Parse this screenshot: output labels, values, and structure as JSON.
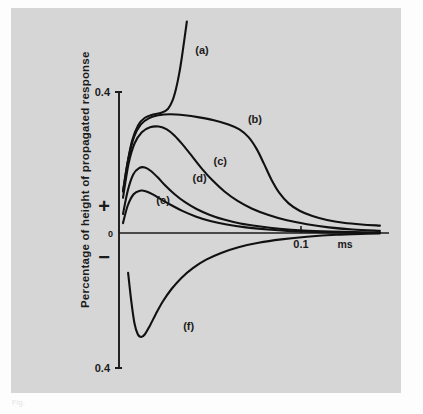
{
  "figure": {
    "background_color": "#d6d6d6",
    "page_color": "#fdfdfd",
    "ink_color": "#111111",
    "caption_fragment": "Fig."
  },
  "chart_data": {
    "type": "line",
    "title": "",
    "xlabel": "",
    "ylabel": "Percentage of height of propagated response",
    "x_unit": "ms",
    "xlim": [
      0,
      0.148
    ],
    "ylim": [
      -0.4,
      0.4
    ],
    "grid": false,
    "legend": "inline-curve-labels",
    "y_ticks": [
      {
        "value": 0.4,
        "label": "0.4"
      },
      {
        "value": 0.0,
        "label": "0"
      },
      {
        "value": -0.4,
        "label": "0.4"
      }
    ],
    "y_sign_markers": [
      {
        "label": "+",
        "value": 0.14
      },
      {
        "label": "−",
        "value": -0.12
      }
    ],
    "x_ticks": [
      {
        "value": 0.1,
        "label": "0.1"
      }
    ],
    "series": [
      {
        "name": "(a)",
        "label": "(a)",
        "label_x": 0.0455,
        "label_y": 0.508,
        "description": "steeply rising curve leaving top of plot",
        "points": [
          [
            0.0022,
            0.118
          ],
          [
            0.0046,
            0.196
          ],
          [
            0.0072,
            0.262
          ],
          [
            0.0105,
            0.306
          ],
          [
            0.0142,
            0.327
          ],
          [
            0.0186,
            0.336
          ],
          [
            0.0232,
            0.341
          ],
          [
            0.0268,
            0.352
          ],
          [
            0.0292,
            0.374
          ],
          [
            0.0312,
            0.408
          ],
          [
            0.033,
            0.452
          ],
          [
            0.0345,
            0.5
          ],
          [
            0.0358,
            0.548
          ],
          [
            0.0372,
            0.6
          ]
        ]
      },
      {
        "name": "(b)",
        "label": "(b)",
        "label_x": 0.0745,
        "label_y": 0.312,
        "description": "broad plateau then steep late fall with long tail",
        "points": [
          [
            0.0022,
            0.118
          ],
          [
            0.005,
            0.208
          ],
          [
            0.0082,
            0.272
          ],
          [
            0.012,
            0.308
          ],
          [
            0.0165,
            0.326
          ],
          [
            0.0215,
            0.334
          ],
          [
            0.028,
            0.337
          ],
          [
            0.036,
            0.334
          ],
          [
            0.044,
            0.328
          ],
          [
            0.052,
            0.32
          ],
          [
            0.06,
            0.308
          ],
          [
            0.066,
            0.294
          ],
          [
            0.071,
            0.272
          ],
          [
            0.0755,
            0.238
          ],
          [
            0.0795,
            0.196
          ],
          [
            0.0835,
            0.152
          ],
          [
            0.088,
            0.113
          ],
          [
            0.093,
            0.084
          ],
          [
            0.099,
            0.063
          ],
          [
            0.106,
            0.048
          ],
          [
            0.114,
            0.037
          ],
          [
            0.123,
            0.029
          ],
          [
            0.133,
            0.024
          ],
          [
            0.143,
            0.021
          ]
        ]
      },
      {
        "name": "(c)",
        "label": "(c)",
        "label_x": 0.0555,
        "label_y": 0.193,
        "description": "rounded peak then smooth monotone decay",
        "points": [
          [
            0.0022,
            0.1
          ],
          [
            0.0052,
            0.196
          ],
          [
            0.0085,
            0.254
          ],
          [
            0.0125,
            0.286
          ],
          [
            0.017,
            0.3
          ],
          [
            0.0218,
            0.302
          ],
          [
            0.0262,
            0.294
          ],
          [
            0.0305,
            0.276
          ],
          [
            0.035,
            0.25
          ],
          [
            0.04,
            0.218
          ],
          [
            0.0455,
            0.182
          ],
          [
            0.0515,
            0.148
          ],
          [
            0.058,
            0.117
          ],
          [
            0.065,
            0.091
          ],
          [
            0.073,
            0.069
          ],
          [
            0.082,
            0.051
          ],
          [
            0.092,
            0.036
          ],
          [
            0.103,
            0.025
          ],
          [
            0.115,
            0.016
          ],
          [
            0.128,
            0.01
          ],
          [
            0.143,
            0.006
          ]
        ]
      },
      {
        "name": "(d)",
        "label": "(d)",
        "label_x": 0.0442,
        "label_y": 0.145,
        "description": "sharp early peak then fast decay",
        "points": [
          [
            0.0022,
            0.054
          ],
          [
            0.0048,
            0.12
          ],
          [
            0.0078,
            0.166
          ],
          [
            0.011,
            0.184
          ],
          [
            0.0142,
            0.186
          ],
          [
            0.0175,
            0.176
          ],
          [
            0.0212,
            0.158
          ],
          [
            0.0255,
            0.134
          ],
          [
            0.0305,
            0.11
          ],
          [
            0.036,
            0.088
          ],
          [
            0.0425,
            0.068
          ],
          [
            0.0495,
            0.052
          ],
          [
            0.0575,
            0.038
          ],
          [
            0.0665,
            0.027
          ],
          [
            0.0765,
            0.019
          ],
          [
            0.088,
            0.012
          ],
          [
            0.101,
            0.007
          ],
          [
            0.116,
            0.004
          ],
          [
            0.133,
            0.002
          ],
          [
            0.143,
            0.001
          ]
        ]
      },
      {
        "name": "(e)",
        "label": "(e)",
        "label_x": 0.0242,
        "label_y": 0.083,
        "description": "small early peak then rapid decay to baseline",
        "points": [
          [
            0.0022,
            0.028
          ],
          [
            0.0048,
            0.078
          ],
          [
            0.008,
            0.11
          ],
          [
            0.0115,
            0.12
          ],
          [
            0.015,
            0.118
          ],
          [
            0.019,
            0.108
          ],
          [
            0.0235,
            0.094
          ],
          [
            0.029,
            0.078
          ],
          [
            0.035,
            0.062
          ],
          [
            0.042,
            0.047
          ],
          [
            0.05,
            0.034
          ],
          [
            0.059,
            0.024
          ],
          [
            0.0695,
            0.016
          ],
          [
            0.0815,
            0.01
          ],
          [
            0.095,
            0.005
          ],
          [
            0.111,
            0.002
          ],
          [
            0.128,
            0.001
          ],
          [
            0.143,
            0.0
          ]
        ]
      },
      {
        "name": "(f)",
        "label": "(f)",
        "label_x": 0.0382,
        "label_y": -0.288,
        "description": "negative trough then asymptotic rise toward zero",
        "points": [
          [
            0.005,
            -0.118
          ],
          [
            0.0068,
            -0.205
          ],
          [
            0.0085,
            -0.268
          ],
          [
            0.0103,
            -0.3
          ],
          [
            0.0122,
            -0.308
          ],
          [
            0.0142,
            -0.3
          ],
          [
            0.0168,
            -0.276
          ],
          [
            0.02,
            -0.242
          ],
          [
            0.024,
            -0.203
          ],
          [
            0.0288,
            -0.166
          ],
          [
            0.0342,
            -0.133
          ],
          [
            0.0405,
            -0.104
          ],
          [
            0.0478,
            -0.079
          ],
          [
            0.056,
            -0.059
          ],
          [
            0.0655,
            -0.042
          ],
          [
            0.0765,
            -0.029
          ],
          [
            0.089,
            -0.019
          ],
          [
            0.103,
            -0.011
          ],
          [
            0.119,
            -0.005
          ],
          [
            0.136,
            -0.002
          ],
          [
            0.143,
            -0.001
          ]
        ]
      }
    ]
  }
}
